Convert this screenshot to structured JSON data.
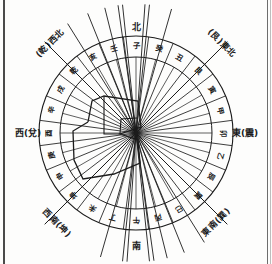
{
  "figure": {
    "type": "chinese-24-mountain-compass",
    "center": {
      "x": 136,
      "y": 133
    },
    "outer_radius": 97,
    "inner_radius": 76
  },
  "cardinal_labels": [
    {
      "name": "north",
      "text": "北",
      "x": 136,
      "y": 30,
      "rotate": 0
    },
    {
      "name": "south",
      "text": "南",
      "x": 136,
      "y": 249,
      "rotate": 0
    },
    {
      "name": "east",
      "text": "東(震)",
      "x": 245,
      "y": 136,
      "rotate": 0
    },
    {
      "name": "west",
      "text": "西(兌)",
      "x": 28,
      "y": 136,
      "rotate": 0
    }
  ],
  "diagonal_labels": [
    {
      "name": "northwest",
      "text": "(乾)西北",
      "x": 52,
      "y": 45,
      "rotate": -45
    },
    {
      "name": "northeast",
      "text": "(艮)東北",
      "x": 220,
      "y": 45,
      "rotate": 45
    },
    {
      "name": "southwest",
      "text": "西南(坤)",
      "x": 55,
      "y": 225,
      "rotate": 45
    },
    {
      "name": "southeast",
      "text": "東南(巽)",
      "x": 218,
      "y": 224,
      "rotate": -45
    }
  ],
  "ring_sectors": [
    {
      "index": 0,
      "text": "子",
      "angle": 0
    },
    {
      "index": 1,
      "text": "癸",
      "angle": 15
    },
    {
      "index": 2,
      "text": "丑",
      "angle": 30
    },
    {
      "index": 3,
      "text": "艮",
      "angle": 45
    },
    {
      "index": 4,
      "text": "寅",
      "angle": 60
    },
    {
      "index": 5,
      "text": "甲",
      "angle": 75
    },
    {
      "index": 6,
      "text": "卯",
      "angle": 90
    },
    {
      "index": 7,
      "text": "乙",
      "angle": 105
    },
    {
      "index": 8,
      "text": "辰",
      "angle": 120
    },
    {
      "index": 9,
      "text": "巽",
      "angle": 135
    },
    {
      "index": 10,
      "text": "巳",
      "angle": 150
    },
    {
      "index": 11,
      "text": "丙",
      "angle": 165
    },
    {
      "index": 12,
      "text": "午",
      "angle": 180
    },
    {
      "index": 13,
      "text": "丁",
      "angle": 195
    },
    {
      "index": 14,
      "text": "未",
      "angle": 210
    },
    {
      "index": 15,
      "text": "坤",
      "angle": 225
    },
    {
      "index": 16,
      "text": "申",
      "angle": 240
    },
    {
      "index": 17,
      "text": "庚",
      "angle": 255
    },
    {
      "index": 18,
      "text": "酉",
      "angle": 270
    },
    {
      "index": 19,
      "text": "辛",
      "angle": 285
    },
    {
      "index": 20,
      "text": "戌",
      "angle": 300
    },
    {
      "index": 21,
      "text": "乾",
      "angle": 315
    },
    {
      "index": 22,
      "text": "亥",
      "angle": 330
    },
    {
      "index": 23,
      "text": "壬",
      "angle": 345
    }
  ],
  "site_outline": {
    "name": "site-plan-overlay",
    "points": "88,122 92,101 104,96 138,101 141,127 120,134 138,140 140,163 114,174 83,179 74,160 73,131",
    "inner_points": "104,96 104,134 120,134 121,119 137,118"
  },
  "colors": {
    "ink": "#1b1b1b",
    "paper": "#fdfdfc",
    "border": "#4a4a4a"
  }
}
